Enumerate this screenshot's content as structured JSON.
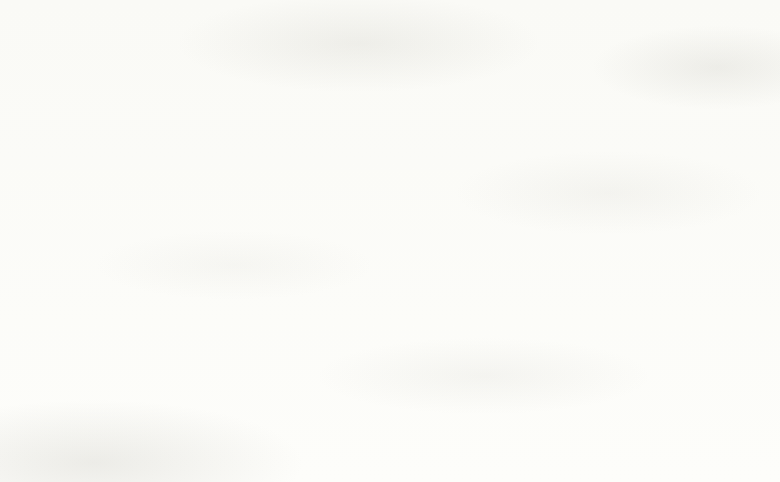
{
  "chart_data": {
    "type": "bar",
    "orientation": "horizontal",
    "stacked": true,
    "title": "Effectiveness of Measures for Tackling Climate Change",
    "xlabel": "",
    "ylabel": "",
    "xlim": [
      0,
      100
    ],
    "xticks": [
      "0%",
      "20%",
      "40%",
      "60%",
      "80%",
      "100%"
    ],
    "xtick_values": [
      0,
      20,
      40,
      60,
      80,
      100
    ],
    "grid": false,
    "legend_position": "bottom",
    "categories": [
      "Limit Population Growth",
      "Lifestyle Changes",
      "New Economic Models",
      "Government Regulation",
      "Market Mechanisms",
      "Technological Innovations"
    ],
    "series": [
      {
        "name": "1: Disagree Strongly",
        "color": "#dcdcd6",
        "values": [
          14.7,
          5.0,
          5.0,
          4.0,
          6.8,
          5.0
        ]
      },
      {
        "name": "2",
        "color": "#c9c8c1",
        "values": [
          16.0,
          0.0,
          0.0,
          0.0,
          8.1,
          0.0
        ]
      },
      {
        "name": "6",
        "color": "#848379",
        "values": [
          15.3,
          22.8,
          22.7,
          22.3,
          20.3,
          23.0
        ]
      },
      {
        "name": "7: Agree Strongly",
        "color": "#6d6c64",
        "values": [
          5.2,
          38.8,
          41.0,
          39.9,
          11.3,
          29.9
        ]
      }
    ],
    "bars": [
      {
        "category": "Limit Population Growth",
        "segments": [
          {
            "series": "1: Disagree Strongly",
            "start": 0.0,
            "width": 14.7
          },
          {
            "series": "2",
            "start": 14.7,
            "width": 16.0
          },
          {
            "series": "6",
            "start": 79.5,
            "width": 15.3
          },
          {
            "series": "7: Agree Strongly",
            "start": 94.8,
            "width": 5.2
          }
        ]
      },
      {
        "category": "Lifestyle Changes",
        "segments": [
          {
            "series": "1: Disagree Strongly",
            "start": 0.0,
            "width": 5.0
          },
          {
            "series": "6",
            "start": 38.3,
            "width": 22.8
          },
          {
            "series": "7: Agree Strongly",
            "start": 61.1,
            "width": 38.8
          }
        ]
      },
      {
        "category": "New Economic Models",
        "segments": [
          {
            "series": "1: Disagree Strongly",
            "start": 0.0,
            "width": 5.0
          },
          {
            "series": "6",
            "start": 36.3,
            "width": 22.7
          },
          {
            "series": "7: Agree Strongly",
            "start": 59.0,
            "width": 41.0
          }
        ]
      },
      {
        "category": "Government Regulation",
        "segments": [
          {
            "series": "1: Disagree Strongly",
            "start": 0.0,
            "width": 4.0
          },
          {
            "series": "6",
            "start": 37.8,
            "width": 22.3
          },
          {
            "series": "7: Agree Strongly",
            "start": 60.1,
            "width": 39.9
          }
        ]
      },
      {
        "category": "Market Mechanisms",
        "segments": [
          {
            "series": "1: Disagree Strongly",
            "start": 0.0,
            "width": 6.8
          },
          {
            "series": "2",
            "start": 6.8,
            "width": 8.1
          },
          {
            "series": "6",
            "start": 68.4,
            "width": 20.3
          },
          {
            "series": "7: Agree Strongly",
            "start": 88.7,
            "width": 11.3
          }
        ]
      },
      {
        "category": "Technological Innovations",
        "segments": [
          {
            "series": "1: Disagree Strongly",
            "start": 0.0,
            "width": 5.0
          },
          {
            "series": "6",
            "start": 47.1,
            "width": 23.0
          },
          {
            "series": "7: Agree Strongly",
            "start": 70.1,
            "width": 29.9
          }
        ]
      }
    ],
    "legend": [
      {
        "label": "1: Disagree Strongly",
        "color": "#dcdcd6"
      },
      {
        "label": "2",
        "color": "#c9c8c1"
      },
      {
        "label": "6",
        "color": "#848379"
      },
      {
        "label": "7: Agree Strongly",
        "color": "#6d6c64"
      }
    ]
  }
}
